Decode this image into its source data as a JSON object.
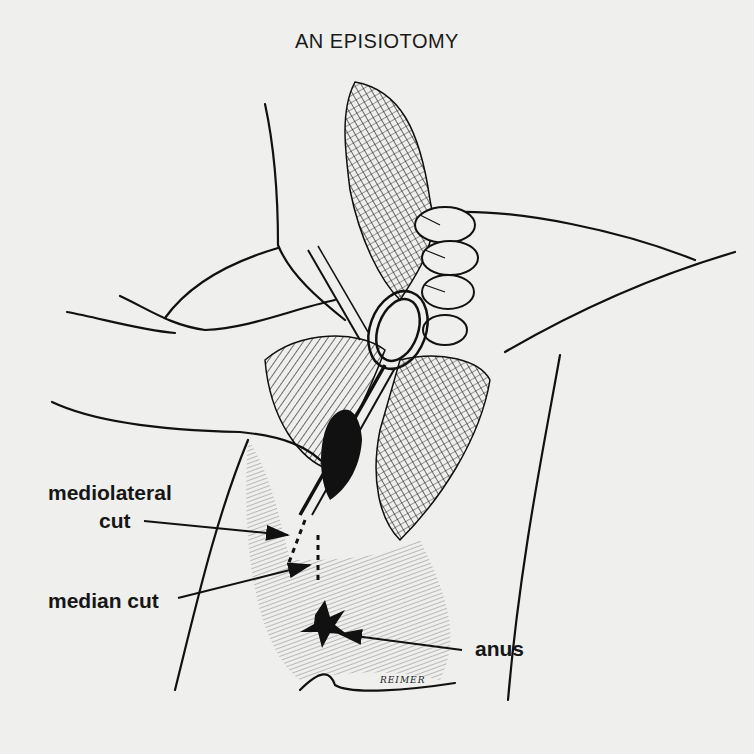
{
  "figure": {
    "title": "AN EPISIOTOMY",
    "background_color": "#efefed",
    "ink_color": "#111111",
    "signature": "REIMER"
  },
  "labels": {
    "mediolateral_line1": "mediolateral",
    "mediolateral_line2": "cut",
    "median": "median cut",
    "anus": "anus"
  }
}
